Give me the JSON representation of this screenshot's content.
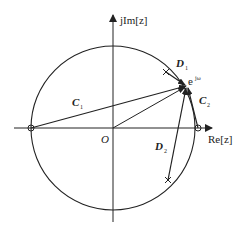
{
  "diagram": {
    "axes": {
      "imag_label": "jIm[z]",
      "real_label": "Re[z]",
      "origin_label": "O"
    },
    "point_label": "e^{jω}",
    "point_label_base": "e",
    "point_label_sup": "jω",
    "vectors": [
      {
        "name": "C1",
        "base": "C",
        "sub": "1",
        "from": "zero at z=-1",
        "to": "e^{jω}"
      },
      {
        "name": "C2",
        "base": "C",
        "sub": "2",
        "from": "zero at z=1",
        "to": "e^{jω}"
      },
      {
        "name": "D1",
        "base": "D",
        "sub": "1",
        "from": "pole (upper)",
        "to": "e^{jω}"
      },
      {
        "name": "D2",
        "base": "D",
        "sub": "2",
        "from": "pole (lower)",
        "to": "e^{jω}"
      }
    ],
    "zeros": [
      "z = -1",
      "z = 1"
    ],
    "poles": [
      "upper pole",
      "lower pole"
    ]
  }
}
